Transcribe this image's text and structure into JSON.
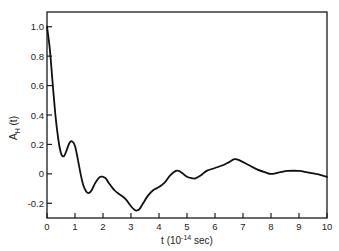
{
  "chart_data": {
    "type": "line",
    "title": "",
    "xlabel": "t (10^-14 sec)",
    "xlabel_parts": {
      "main": "t (10",
      "sup": "-14",
      "tail": " sec)"
    },
    "ylabel": "A_H (t)",
    "ylabel_parts": {
      "main": "A",
      "sub": "H",
      "tail": " (t)"
    },
    "xlim": [
      0,
      10
    ],
    "ylim": [
      -0.3,
      1.1
    ],
    "grid": false,
    "legend": null,
    "x_ticks": [
      "0",
      "1",
      "2",
      "3",
      "4",
      "5",
      "6",
      "7",
      "8",
      "9",
      "10"
    ],
    "y_ticks": [
      "1.0",
      "0.8",
      "0.6",
      "0.4",
      "0.2",
      "0",
      "-0.2"
    ],
    "y_tick_values": [
      1.0,
      0.8,
      0.6,
      0.4,
      0.2,
      0,
      -0.2
    ],
    "series": [
      {
        "name": "A_H(t)",
        "x": [
          0,
          0.1,
          0.2,
          0.3,
          0.4,
          0.5,
          0.6,
          0.7,
          0.8,
          0.9,
          1.0,
          1.1,
          1.2,
          1.3,
          1.4,
          1.5,
          1.6,
          1.7,
          1.8,
          1.9,
          2.0,
          2.1,
          2.2,
          2.4,
          2.6,
          2.8,
          3.0,
          3.1,
          3.2,
          3.3,
          3.4,
          3.6,
          3.8,
          4.0,
          4.2,
          4.4,
          4.6,
          4.7,
          4.8,
          5.0,
          5.2,
          5.3,
          5.5,
          5.7,
          6.0,
          6.3,
          6.5,
          6.7,
          6.9,
          7.2,
          7.5,
          7.8,
          8.0,
          8.3,
          8.6,
          9.0,
          9.3,
          9.6,
          10.0
        ],
        "y": [
          1.0,
          0.85,
          0.62,
          0.4,
          0.24,
          0.14,
          0.12,
          0.16,
          0.21,
          0.22,
          0.19,
          0.1,
          0.0,
          -0.08,
          -0.12,
          -0.13,
          -0.11,
          -0.07,
          -0.04,
          -0.02,
          -0.02,
          -0.03,
          -0.06,
          -0.11,
          -0.14,
          -0.17,
          -0.22,
          -0.24,
          -0.25,
          -0.24,
          -0.21,
          -0.15,
          -0.11,
          -0.09,
          -0.06,
          -0.01,
          0.02,
          0.02,
          0.01,
          -0.02,
          -0.03,
          -0.03,
          -0.01,
          0.02,
          0.04,
          0.06,
          0.08,
          0.1,
          0.09,
          0.06,
          0.03,
          0.01,
          0.0,
          0.01,
          0.02,
          0.02,
          0.01,
          0.0,
          -0.02
        ]
      }
    ]
  }
}
